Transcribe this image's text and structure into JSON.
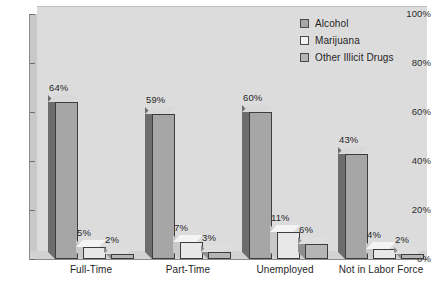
{
  "chart_data": {
    "type": "bar",
    "title": "",
    "subtitle": "",
    "xlabel": "",
    "ylabel": "",
    "categories": [
      "Full-Time",
      "Part-Time",
      "Unemployed",
      "Not in Labor Force"
    ],
    "series": [
      {
        "name": "Alcohol",
        "color": "#a6a6a6",
        "values": [
          64,
          59,
          60,
          43
        ],
        "labels": [
          "64%",
          "59%",
          "60%",
          "43%"
        ]
      },
      {
        "name": "Marijuana",
        "color": "#f2f2f2",
        "values": [
          5,
          7,
          11,
          4
        ],
        "labels": [
          "5%",
          "7%",
          "11%",
          "4%"
        ]
      },
      {
        "name": "Other Illicit Drugs",
        "color": "#b5b5b5",
        "values": [
          2,
          3,
          6,
          2
        ],
        "labels": [
          "2%",
          "3%",
          "6%",
          "2%"
        ]
      }
    ],
    "ylim": [
      0,
      100
    ],
    "yticks": [
      0,
      20,
      40,
      60,
      80,
      100
    ],
    "ytick_labels": [
      "0%",
      "20%",
      "40%",
      "60%",
      "80%",
      "100%"
    ],
    "grid": false,
    "legend_position": "top-right",
    "style": "3d-bar",
    "plot_background": "#dcdcdc",
    "page_background": "#ffffff"
  },
  "legend": {
    "items": [
      {
        "label": "Alcohol"
      },
      {
        "label": "Marijuana"
      },
      {
        "label": "Other Illicit Drugs"
      }
    ]
  },
  "yaxis": {
    "ticks": [
      {
        "label": "100%"
      },
      {
        "label": "80%"
      },
      {
        "label": "60%"
      },
      {
        "label": "40%"
      },
      {
        "label": "20%"
      },
      {
        "label": "0%"
      }
    ]
  },
  "xaxis": {
    "categories": [
      {
        "label": "Full-Time"
      },
      {
        "label": "Part-Time"
      },
      {
        "label": "Unemployed"
      },
      {
        "label": "Not in Labor Force"
      }
    ]
  }
}
